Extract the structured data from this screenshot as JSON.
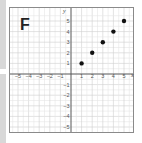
{
  "panel_label": "F",
  "chart_data": {
    "type": "scatter",
    "title": "",
    "xlabel": "x",
    "ylabel": "y",
    "xlim": [
      -5.5,
      5.5
    ],
    "ylim": [
      -5.5,
      5.5
    ],
    "grid": true,
    "x_ticks": [
      -5,
      -4,
      -3,
      -2,
      -1,
      1,
      2,
      3,
      4,
      5
    ],
    "y_ticks": [
      5,
      4,
      3,
      2,
      1,
      -1,
      -2,
      -3,
      -4,
      -5
    ],
    "x_tick_labels": [
      "−5",
      "−4",
      "−3",
      "−2",
      "−1",
      "1",
      "2",
      "3",
      "4",
      "5"
    ],
    "y_tick_labels": [
      "5",
      "4",
      "3",
      "2",
      "1",
      "−1",
      "−2",
      "−3",
      "−4",
      "−5"
    ],
    "points": [
      {
        "x": 1,
        "y": 1
      },
      {
        "x": 2,
        "y": 2
      },
      {
        "x": 3,
        "y": 3
      },
      {
        "x": 4,
        "y": 4
      },
      {
        "x": 5,
        "y": 5
      }
    ],
    "colors": {
      "grid": "#cfcfcf",
      "axis": "#555555",
      "point": "#111111"
    }
  }
}
